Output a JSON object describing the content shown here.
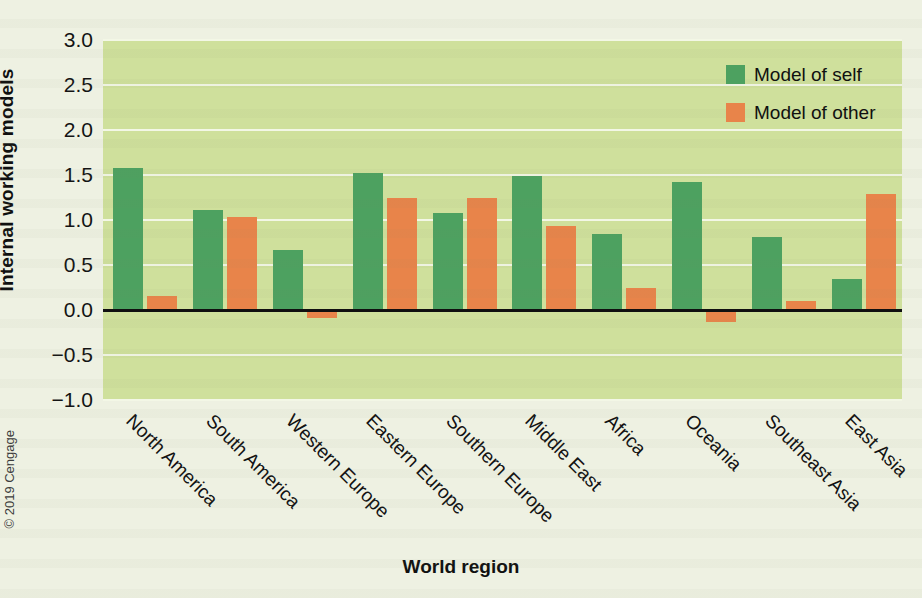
{
  "chart_data": {
    "type": "bar",
    "title": "",
    "xlabel": "World region",
    "ylabel": "Internal working models",
    "ylim": [
      -1.0,
      3.0
    ],
    "yticks": [
      "3.0",
      "2.5",
      "2.0",
      "1.5",
      "1.0",
      "0.5",
      "0.0",
      "−0.5",
      "−1.0"
    ],
    "ytick_values": [
      3.0,
      2.5,
      2.0,
      1.5,
      1.0,
      0.5,
      0.0,
      -0.5,
      -1.0
    ],
    "grid": true,
    "legend_position": "top-right",
    "categories": [
      "North America",
      "South America",
      "Western Europe",
      "Eastern Europe",
      "Southern Europe",
      "Middle East",
      "Africa",
      "Oceania",
      "Southeast Asia",
      "East Asia"
    ],
    "series": [
      {
        "name": "Model of self",
        "color": "#4da160",
        "values": [
          1.58,
          1.11,
          0.67,
          1.52,
          1.08,
          1.49,
          0.85,
          1.42,
          0.81,
          0.35
        ]
      },
      {
        "name": "Model of other",
        "color": "#e8844a",
        "values": [
          0.16,
          1.03,
          -0.09,
          1.25,
          1.25,
          0.93,
          0.24,
          -0.13,
          0.1,
          1.29
        ]
      }
    ]
  },
  "legend": {
    "items": [
      {
        "label": "Model of self",
        "color": "#4da160"
      },
      {
        "label": "Model of other",
        "color": "#e8844a"
      }
    ]
  },
  "credit": "© 2019 Cengage",
  "colors": {
    "plot_background": "#cfe09c",
    "page_background": "#eef1e2",
    "gridline": "#f3f7e6",
    "axis_line": "#101010",
    "series_self": "#4da160",
    "series_other": "#e8844a"
  }
}
